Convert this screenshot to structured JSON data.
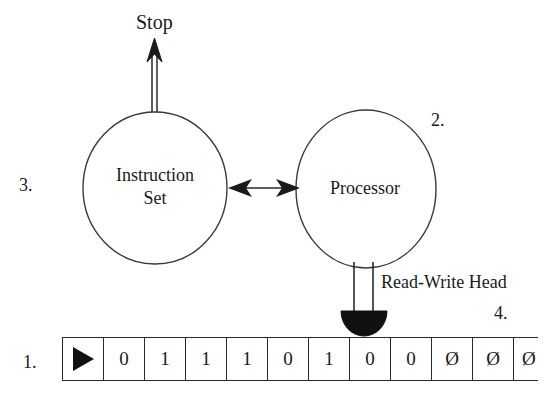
{
  "diagram": {
    "background_color": "#ffffff",
    "ink_color": "#1a1a1a"
  },
  "nodes": {
    "instruction_set": {
      "label_line1": "Instruction",
      "label_line2": "Set",
      "shape": "ellipse"
    },
    "processor": {
      "label": "Processor",
      "shape": "ellipse"
    }
  },
  "edges": {
    "stop_arrow": {
      "label": "Stop",
      "style": "double-line-open-arrow",
      "direction": "up"
    },
    "bidirectional_link": {
      "label": "",
      "style": "double-headed-arrow",
      "direction": "both"
    },
    "head_connector": {
      "style": "double-line",
      "direction": "down"
    }
  },
  "read_write_head": {
    "label": "Read-Write Head",
    "shape": "filled-semicircle",
    "fill_color": "#111111"
  },
  "callouts": [
    {
      "id": "1",
      "text": "1.",
      "target": "tape"
    },
    {
      "id": "2",
      "text": "2.",
      "target": "processor"
    },
    {
      "id": "3",
      "text": "3.",
      "target": "instruction-set"
    },
    {
      "id": "4",
      "text": "4.",
      "target": "read-write-head"
    }
  ],
  "tape": {
    "cells": [
      {
        "type": "marker",
        "value": ""
      },
      {
        "type": "symbol",
        "value": "0"
      },
      {
        "type": "symbol",
        "value": "1"
      },
      {
        "type": "symbol",
        "value": "1"
      },
      {
        "type": "symbol",
        "value": "1"
      },
      {
        "type": "symbol",
        "value": "0"
      },
      {
        "type": "symbol",
        "value": "1"
      },
      {
        "type": "symbol",
        "value": "0"
      },
      {
        "type": "symbol",
        "value": "0"
      },
      {
        "type": "symbol",
        "value": "Ø"
      },
      {
        "type": "symbol",
        "value": "Ø"
      },
      {
        "type": "symbol",
        "value": "Ø",
        "clipped": true
      }
    ],
    "marker_glyph": "start-triangle"
  }
}
